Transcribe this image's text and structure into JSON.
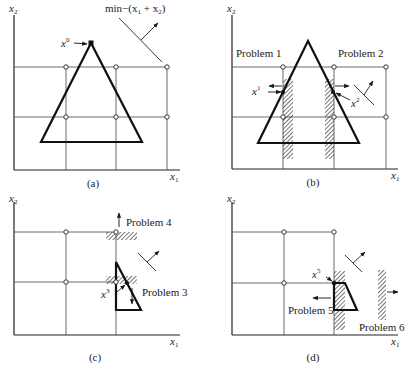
{
  "figure": {
    "panels": [
      {
        "id": "a",
        "caption": "(a)",
        "x_axis_label": "x",
        "x_axis_sub": "1",
        "y_axis_label": "x",
        "y_axis_sub": "2",
        "objective_label": "min−(x",
        "objective_sub1": "1",
        "objective_plus": " + x",
        "objective_sub2": "2",
        "objective_close": ")",
        "point_label": "x",
        "point_sup": "0"
      },
      {
        "id": "b",
        "caption": "(b)",
        "x_axis_label": "x",
        "x_axis_sub": "1",
        "y_axis_label": "x",
        "y_axis_sub": "2",
        "problem_left": "Problem 1",
        "problem_right": "Problem 2",
        "point1_label": "x",
        "point1_sup": "1",
        "point2_label": "x",
        "point2_sup": "2"
      },
      {
        "id": "c",
        "caption": "(c)",
        "x_axis_label": "x",
        "x_axis_sub": "1",
        "y_axis_label": "x",
        "y_axis_sub": "2",
        "problem_top": "Problem 4",
        "problem_bottom": "Problem 3",
        "point_label": "x",
        "point_sup": "3"
      },
      {
        "id": "d",
        "caption": "(d)",
        "x_axis_label": "x",
        "x_axis_sub": "1",
        "y_axis_label": "x",
        "y_axis_sub": "2",
        "problem_left": "Problem 5",
        "problem_right": "Problem 6",
        "point_label": "x",
        "point_sup": "5"
      }
    ]
  }
}
